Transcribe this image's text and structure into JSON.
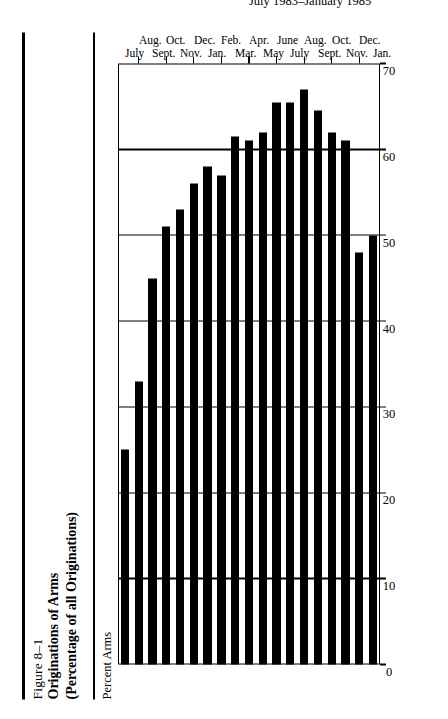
{
  "figure": {
    "number": "Figure 8–1",
    "title": "Originations of Arms",
    "subtitle": "(Percentage of all Originations)"
  },
  "chart_data": {
    "type": "bar",
    "orientation": "horizontal",
    "title": "Originations of Arms",
    "subtitle": "(Percentage of all Originations)",
    "xlabel": "July 1983–January 1985",
    "ylabel": "Percent Arms",
    "ylim": [
      0,
      70
    ],
    "yticks": [
      0,
      10,
      20,
      30,
      40,
      50,
      60,
      70
    ],
    "ytick_labels": [
      "0",
      "10",
      "20",
      "30",
      "40",
      "50",
      "60",
      "70"
    ],
    "grid": true,
    "legend": null,
    "categories": [
      "July",
      "Aug.",
      "Sept.",
      "Oct.",
      "Nov.",
      "Dec.",
      "Jan.",
      "Feb.",
      "Mar.",
      "Apr.",
      "May",
      "June",
      "July",
      "Aug.",
      "Sept.",
      "Oct.",
      "Nov.",
      "Dec.",
      "Jan."
    ],
    "values": [
      25,
      33,
      45,
      51,
      53,
      56,
      58,
      57,
      61.5,
      61,
      62,
      65.5,
      65.5,
      67,
      64.5,
      62,
      61,
      48,
      50
    ]
  }
}
